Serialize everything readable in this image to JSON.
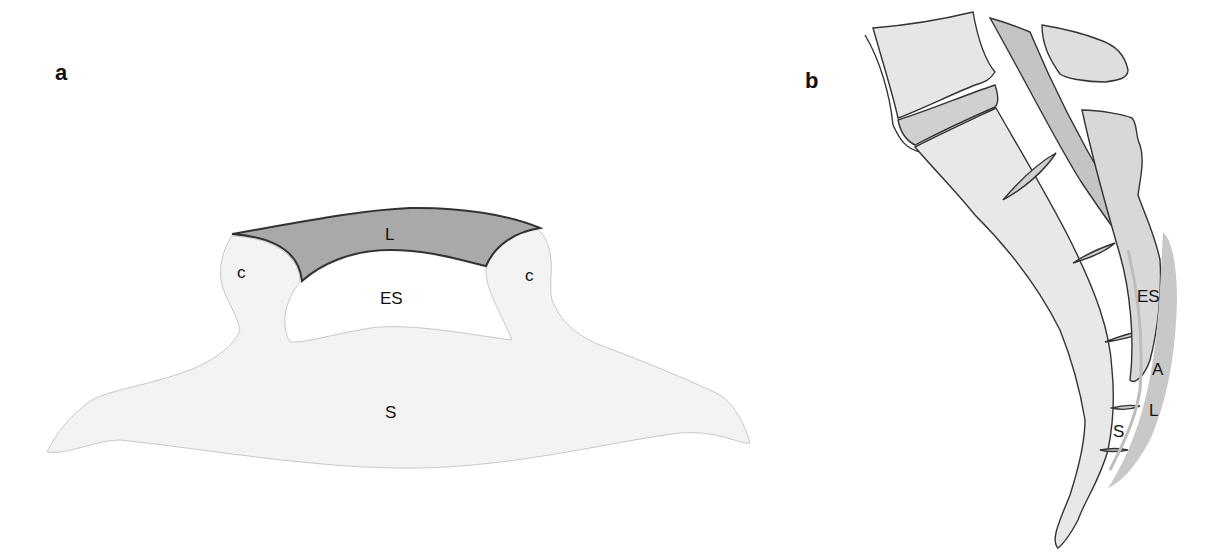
{
  "panels": [
    {
      "id": "a",
      "label": "a",
      "view": "axial cross-section",
      "structure_labels": {
        "ligament": "L",
        "epidural_space": "ES",
        "cornu_left": "c",
        "cornu_right": "c",
        "sacrum": "S"
      }
    },
    {
      "id": "b",
      "label": "b",
      "view": "sagittal section",
      "structure_labels": {
        "epidural_space": "ES",
        "adipose": "A",
        "ligament": "L",
        "sacrum": "S"
      }
    }
  ],
  "colors": {
    "background": "#ffffff",
    "bone_fill": "#f3f3f3",
    "bone_fill_b": "#e4e4e4",
    "ligament_fill": "#a9a9a9",
    "ligament_fill_b": "#c9c9c9",
    "outline": "#333333"
  }
}
